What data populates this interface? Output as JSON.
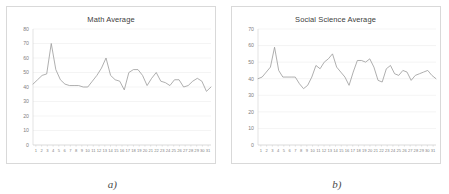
{
  "figure": {
    "background": "#ffffff",
    "line_color": "#9b9b9b",
    "grid_color": "#e8e8e8",
    "text_color": "#7f7f7f"
  },
  "panels": [
    {
      "caption": "a)",
      "chart_data": {
        "type": "line",
        "title": "Math Average",
        "xlabel": "",
        "ylabel": "",
        "grid": true,
        "legend": false,
        "ylim": [
          0,
          80
        ],
        "yticks": [
          0,
          10,
          20,
          30,
          40,
          50,
          60,
          70,
          80
        ],
        "categories": [
          "1",
          "2",
          "3",
          "4",
          "5",
          "6",
          "7",
          "8",
          "9",
          "10",
          "11",
          "12",
          "13",
          "14",
          "15",
          "16",
          "17",
          "18",
          "19",
          "20",
          "21",
          "22",
          "23",
          "24",
          "25",
          "26",
          "27",
          "28",
          "29",
          "30",
          "31"
        ],
        "x": [
          1,
          2,
          3,
          4,
          5,
          6,
          7,
          8,
          9,
          10,
          11,
          12,
          13,
          14,
          15,
          16,
          17,
          18,
          19,
          20,
          21,
          22,
          23,
          24,
          25,
          26,
          27,
          28,
          29,
          30,
          31
        ],
        "values": [
          42,
          45,
          48,
          49,
          70,
          52,
          45,
          42,
          41,
          41,
          41,
          40,
          40,
          44,
          48,
          53,
          60,
          48,
          45,
          44,
          38,
          50,
          52,
          52,
          48,
          41,
          46,
          50,
          44,
          43,
          41,
          45,
          45,
          40,
          41,
          44,
          46,
          44,
          37,
          40
        ]
      }
    },
    {
      "caption": "b)",
      "chart_data": {
        "type": "line",
        "title": "Social Science Average",
        "xlabel": "",
        "ylabel": "",
        "grid": true,
        "legend": false,
        "ylim": [
          0,
          70
        ],
        "yticks": [
          0,
          10,
          20,
          30,
          40,
          50,
          60,
          70
        ],
        "categories": [
          "1",
          "2",
          "3",
          "4",
          "5",
          "6",
          "7",
          "8",
          "9",
          "10",
          "11",
          "12",
          "13",
          "14",
          "15",
          "16",
          "17",
          "18",
          "19",
          "20",
          "21",
          "22",
          "23",
          "24",
          "25",
          "26",
          "27",
          "28",
          "29",
          "30",
          "31"
        ],
        "x": [
          1,
          2,
          3,
          4,
          5,
          6,
          7,
          8,
          9,
          10,
          11,
          12,
          13,
          14,
          15,
          16,
          17,
          18,
          19,
          20,
          21,
          22,
          23,
          24,
          25,
          26,
          27,
          28,
          29,
          30,
          31
        ],
        "values": [
          40,
          41,
          44,
          47,
          59,
          45,
          41,
          41,
          41,
          41,
          37,
          34,
          36,
          41,
          48,
          46,
          50,
          52,
          55,
          47,
          44,
          41,
          36,
          44,
          51,
          51,
          50,
          52,
          47,
          39,
          38,
          46,
          48,
          43,
          42,
          45,
          44,
          39,
          42,
          43,
          44,
          45,
          42,
          40
        ]
      }
    }
  ]
}
